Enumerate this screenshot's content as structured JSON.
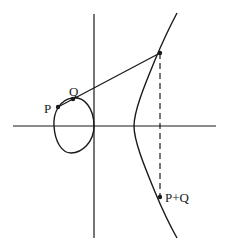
{
  "diagram": {
    "colors": {
      "ink": "#1a1a1a",
      "background": "#ffffff"
    },
    "labels": {
      "p": "P",
      "q": "Q",
      "sum": "P+Q"
    },
    "axes": {
      "x_axis": {
        "x1": 13,
        "y": 126,
        "x2": 216
      },
      "y_axis": {
        "x": 94,
        "y1": 14,
        "y2": 238
      }
    },
    "points": {
      "P": [
        58,
        107
      ],
      "Q": [
        73,
        99
      ],
      "third_intersection": [
        160,
        53
      ],
      "P_plus_Q": [
        160,
        197
      ]
    }
  }
}
